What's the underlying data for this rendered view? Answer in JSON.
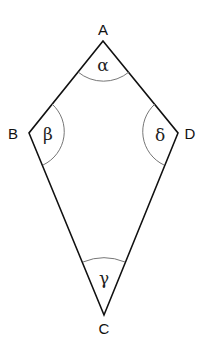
{
  "diagram": {
    "type": "kite quadrilateral",
    "vertices": [
      {
        "id": "A",
        "label": "A",
        "x": 103,
        "y": 41
      },
      {
        "id": "B",
        "label": "B",
        "x": 29,
        "y": 133
      },
      {
        "id": "C",
        "label": "C",
        "x": 104,
        "y": 315
      },
      {
        "id": "D",
        "label": "D",
        "x": 178,
        "y": 133
      }
    ],
    "edges": [
      [
        "A",
        "B"
      ],
      [
        "B",
        "C"
      ],
      [
        "C",
        "D"
      ],
      [
        "D",
        "A"
      ]
    ],
    "angles": [
      {
        "vertex": "A",
        "label": "α"
      },
      {
        "vertex": "B",
        "label": "β"
      },
      {
        "vertex": "C",
        "label": "γ"
      },
      {
        "vertex": "D",
        "label": "δ"
      }
    ]
  },
  "labels": {
    "A": "A",
    "B": "B",
    "C": "C",
    "D": "D",
    "alpha": "α",
    "beta": "β",
    "gamma": "γ",
    "delta": "δ"
  },
  "colors": {
    "line": "#111111",
    "arc": "#666666",
    "background": "#ffffff"
  }
}
